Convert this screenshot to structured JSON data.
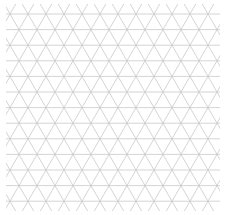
{
  "diagram": {
    "type": "isometric-triangle-grid",
    "canvas": {
      "width": 228,
      "height": 215,
      "background": "#ffffff"
    },
    "grid": {
      "origin_x": 10,
      "origin_y": 14,
      "side": 18,
      "row_height": 15.6,
      "rows": 13,
      "columns": 12,
      "x_min": 6,
      "x_max": 220,
      "y_min": 4,
      "y_max": 211,
      "line_color": "#c9c9c9",
      "line_width": 0.8
    }
  }
}
